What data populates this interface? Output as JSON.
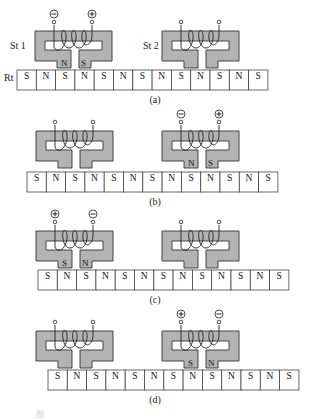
{
  "figure": {
    "stator_labels": {
      "st1": "St 1",
      "st2": "St 2"
    },
    "rotor_label": "Rt",
    "colors": {
      "stator_fill": "#b3b3b3",
      "outline": "#333333",
      "background": "#ffffff"
    },
    "panels": [
      {
        "id": "a",
        "caption": "(a)",
        "rotor_poles": [
          "S",
          "N",
          "S",
          "N",
          "S",
          "N",
          "S",
          "N",
          "S",
          "N",
          "S",
          "N",
          "S"
        ],
        "rotor_x": 17,
        "rotor_y": 70,
        "stators": [
          {
            "name": "St 1",
            "x": 35,
            "y": 31,
            "energized": true,
            "terminals": [
              "-",
              "+"
            ],
            "foot_poles": [
              "N",
              "S"
            ]
          },
          {
            "name": "St 2",
            "x": 162,
            "y": 31,
            "energized": false,
            "terminals": [
              null,
              null
            ],
            "foot_poles": [
              null,
              null
            ]
          }
        ],
        "show_labels": true
      },
      {
        "id": "b",
        "caption": "(b)",
        "rotor_poles": [
          "S",
          "N",
          "S",
          "N",
          "S",
          "N",
          "S",
          "N",
          "S",
          "N",
          "S",
          "N",
          "S"
        ],
        "rotor_x": 27,
        "rotor_y": 172,
        "stators": [
          {
            "name": "St 1",
            "x": 36,
            "y": 131,
            "energized": false,
            "terminals": [
              null,
              null
            ],
            "foot_poles": [
              null,
              null
            ]
          },
          {
            "name": "St 2",
            "x": 162,
            "y": 131,
            "energized": true,
            "terminals": [
              "-",
              "+"
            ],
            "foot_poles": [
              "N",
              "S"
            ]
          }
        ],
        "show_labels": false
      },
      {
        "id": "c",
        "caption": "(c)",
        "rotor_poles": [
          "S",
          "N",
          "S",
          "N",
          "S",
          "N",
          "S",
          "N",
          "S",
          "N",
          "S",
          "N",
          "S"
        ],
        "rotor_x": 38,
        "rotor_y": 270,
        "stators": [
          {
            "name": "St 1",
            "x": 36,
            "y": 231,
            "energized": true,
            "terminals": [
              "+",
              "-"
            ],
            "foot_poles": [
              "S",
              "N"
            ]
          },
          {
            "name": "St 2",
            "x": 162,
            "y": 231,
            "energized": false,
            "terminals": [
              null,
              null
            ],
            "foot_poles": [
              null,
              null
            ]
          }
        ],
        "show_labels": false
      },
      {
        "id": "d",
        "caption": "(d)",
        "rotor_poles": [
          "S",
          "N",
          "S",
          "N",
          "S",
          "N",
          "S",
          "N",
          "S",
          "N",
          "S",
          "N",
          "S"
        ],
        "rotor_x": 48,
        "rotor_y": 370,
        "stators": [
          {
            "name": "St 1",
            "x": 36,
            "y": 331,
            "energized": false,
            "terminals": [
              null,
              null
            ],
            "foot_poles": [
              null,
              null
            ]
          },
          {
            "name": "St 2",
            "x": 162,
            "y": 331,
            "energized": true,
            "terminals": [
              "+",
              "-"
            ],
            "foot_poles": [
              "S",
              "N"
            ]
          }
        ],
        "show_labels": false
      }
    ],
    "footer_caption": "图"
  }
}
